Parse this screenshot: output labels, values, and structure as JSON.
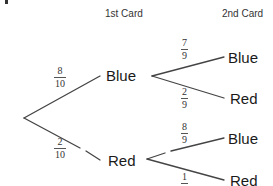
{
  "headers": {
    "first": "1st Card",
    "second": "2nd Card"
  },
  "first_level": [
    {
      "label": "Blue",
      "probability": {
        "numerator": "8",
        "denominator": "10"
      }
    },
    {
      "label": "Red",
      "probability": {
        "numerator": "2",
        "denominator": "10"
      }
    }
  ],
  "second_level": {
    "after_blue": [
      {
        "label": "Blue",
        "probability": {
          "numerator": "7",
          "denominator": "9"
        }
      },
      {
        "label": "Red",
        "probability": {
          "numerator": "2",
          "denominator": "9"
        }
      }
    ],
    "after_red": [
      {
        "label": "Blue",
        "probability": {
          "numerator": "8",
          "denominator": "9"
        }
      },
      {
        "label": "Red",
        "probability": {
          "numerator": "1",
          "denominator": "9"
        }
      }
    ]
  },
  "colors": {
    "line": "#444444",
    "text": "#1a1a1a",
    "background": "#ffffff"
  }
}
